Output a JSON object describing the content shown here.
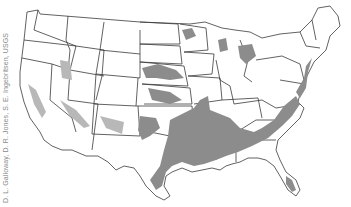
{
  "map": {
    "title": "Areas of land subsidence in the conterminous United States",
    "region": "Conterminous United States",
    "legend_colors": {
      "subsidence_area": "#8c8c8c",
      "state_outline": "#3a3a3a",
      "background": "#ffffff"
    }
  },
  "credit": {
    "text": "D. L. Galloway, D. R. Jones, S. E. Ingebritsen, USGS"
  }
}
